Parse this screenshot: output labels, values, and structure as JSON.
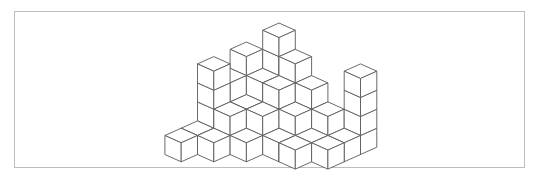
{
  "figure": {
    "type": "isometric-cube-structure",
    "frame_border_color": "#bdbdbd",
    "stroke_color": "#5a5a5a",
    "fill_color": "#ffffff",
    "projection": {
      "origin_x": 279,
      "origin_y": 118,
      "dx": 16.3,
      "dy": 7.3,
      "dz": 19
    },
    "columns": [
      {
        "x": -1,
        "y": 1,
        "h": 4
      },
      {
        "x": -1,
        "y": 2,
        "h": 3
      },
      {
        "x": -1,
        "y": 3,
        "h": 4
      },
      {
        "x": -1,
        "y": 4,
        "h": 1
      },
      {
        "x": -1,
        "y": 5,
        "h": 1
      },
      {
        "x": 0,
        "y": 0,
        "h": 5
      },
      {
        "x": 0,
        "y": 1,
        "h": 3
      },
      {
        "x": 0,
        "y": 2,
        "h": 2
      },
      {
        "x": 0,
        "y": 3,
        "h": 2
      },
      {
        "x": 0,
        "y": 4,
        "h": 1
      },
      {
        "x": 1,
        "y": 0,
        "h": 4
      },
      {
        "x": 1,
        "y": 1,
        "h": 3
      },
      {
        "x": 1,
        "y": 2,
        "h": 2
      },
      {
        "x": 1,
        "y": 3,
        "h": 1
      },
      {
        "x": 2,
        "y": 0,
        "h": 3
      },
      {
        "x": 2,
        "y": 1,
        "h": 2
      },
      {
        "x": 2,
        "y": 2,
        "h": 1
      },
      {
        "x": 3,
        "y": 0,
        "h": 2
      },
      {
        "x": 3,
        "y": 1,
        "h": 1
      },
      {
        "x": 3,
        "y": 2,
        "h": 1
      },
      {
        "x": 4,
        "y": -1,
        "h": 4
      },
      {
        "x": 4,
        "y": 0,
        "h": 1
      },
      {
        "x": 4,
        "y": 1,
        "h": 1
      }
    ]
  }
}
